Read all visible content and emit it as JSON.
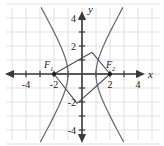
{
  "figure": {
    "background_color": "#ffffff",
    "width": 164,
    "height": 146
  },
  "axes": {
    "x_label": "x",
    "y_label": "y",
    "axis_color": "#3a3a3a",
    "grid_color": "#cfcfd6",
    "x_tick_labels": [
      "-4",
      "-2",
      "2",
      "4"
    ],
    "y_tick_labels": [
      "4",
      "2",
      "-2",
      "-4"
    ],
    "x_tick_values": [
      -4,
      -2,
      2,
      4
    ],
    "y_tick_values": [
      4,
      2,
      -2,
      -4
    ],
    "xlim": [
      -5.6,
      5.6
    ],
    "ylim": [
      -5.0,
      5.0
    ],
    "grid": true
  },
  "annotations": {
    "focus_left_label": "F",
    "focus_left_sub": "1",
    "focus_right_label": "F",
    "focus_right_sub": "2"
  },
  "chart_data": {
    "type": "line",
    "xlabel": "x",
    "ylabel": "y",
    "xlim": [
      -5.6,
      5.6
    ],
    "ylim": [
      -5.0,
      5.0
    ],
    "grid": true,
    "legend": "none",
    "curve_color": "#6b6b70",
    "equation": "x^2/1 - y^2/3 = 1",
    "vertices": [
      [
        -1,
        0
      ],
      [
        1,
        0
      ]
    ],
    "foci": [
      [
        -2,
        0
      ],
      [
        2,
        0
      ]
    ],
    "focus_points": [
      {
        "name": "F1",
        "x": -2,
        "y": 0
      },
      {
        "name": "F2",
        "x": 2,
        "y": 0
      }
    ],
    "point_on_upper": [
      0.72,
      1.55
    ],
    "point_on_lower": [
      -0.35,
      -2.1
    ],
    "segments": [
      {
        "from": [
          -2,
          0
        ],
        "to": [
          0.72,
          1.55
        ]
      },
      {
        "from": [
          2,
          0
        ],
        "to": [
          0.72,
          1.55
        ]
      },
      {
        "from": [
          -2,
          0
        ],
        "to": [
          -0.35,
          -2.1
        ]
      },
      {
        "from": [
          2,
          0
        ],
        "to": [
          -0.35,
          -2.1
        ]
      },
      {
        "from": [
          -2,
          0
        ],
        "to": [
          2,
          0
        ]
      }
    ],
    "series": [
      {
        "name": "left branch",
        "x": [
          -1.0,
          -1.02,
          -1.08,
          -1.2,
          -1.35,
          -1.55,
          -1.8,
          -2.1,
          -2.45,
          -2.8
        ],
        "y": [
          0.0,
          0.25,
          0.5,
          0.95,
          1.4,
          1.95,
          2.5,
          3.2,
          3.9,
          4.6
        ]
      },
      {
        "name": "left branch lower",
        "x": [
          -1.0,
          -1.02,
          -1.08,
          -1.2,
          -1.35,
          -1.55,
          -1.8,
          -2.1,
          -2.45,
          -2.8
        ],
        "y": [
          0.0,
          -0.25,
          -0.5,
          -0.95,
          -1.4,
          -1.95,
          -2.5,
          -3.2,
          -3.9,
          -4.6
        ]
      },
      {
        "name": "right branch",
        "x": [
          1.0,
          1.02,
          1.08,
          1.2,
          1.35,
          1.55,
          1.8,
          2.1,
          2.45,
          2.8
        ],
        "y": [
          0.0,
          0.25,
          0.5,
          0.95,
          1.4,
          1.95,
          2.5,
          3.2,
          3.9,
          4.6
        ]
      },
      {
        "name": "right branch lower",
        "x": [
          1.0,
          1.02,
          1.08,
          1.2,
          1.35,
          1.55,
          1.8,
          2.1,
          2.45,
          2.8
        ],
        "y": [
          0.0,
          -0.25,
          -0.5,
          -0.95,
          -1.4,
          -1.95,
          -2.5,
          -3.2,
          -3.9,
          -4.6
        ]
      }
    ]
  }
}
